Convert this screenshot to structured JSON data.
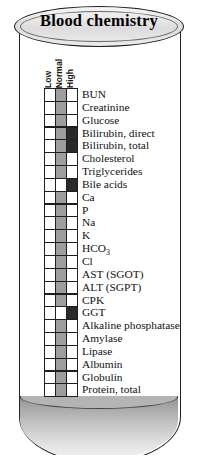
{
  "title": "Blood chemistry",
  "columns": [
    "Low",
    "Normal",
    "High"
  ],
  "legend": {
    "white": "not indicated",
    "gray": "normal range",
    "dark": "abnormal / elevated"
  },
  "colors": {
    "white": "#ffffff",
    "gray": "#9d9d9d",
    "dark": "#2a2a2a",
    "outline": "#1e1e1e",
    "fluid": "#b4b4b4"
  },
  "rows": [
    {
      "label": "BUN",
      "cells": [
        "white",
        "gray",
        "white"
      ]
    },
    {
      "label": "Creatinine",
      "cells": [
        "white",
        "gray",
        "white"
      ]
    },
    {
      "label": "Glucose",
      "cells": [
        "white",
        "gray",
        "white"
      ]
    },
    {
      "label": "Bilirubin, direct",
      "cells": [
        "white",
        "gray",
        "dark"
      ]
    },
    {
      "label": "Bilirubin, total",
      "cells": [
        "white",
        "gray",
        "dark"
      ]
    },
    {
      "label": "Cholesterol",
      "cells": [
        "white",
        "gray",
        "white"
      ]
    },
    {
      "label": "Triglycerides",
      "cells": [
        "white",
        "gray",
        "white"
      ]
    },
    {
      "label": "Bile acids",
      "cells": [
        "white",
        "white",
        "dark"
      ]
    },
    {
      "label": "Ca",
      "cells": [
        "white",
        "gray",
        "white"
      ]
    },
    {
      "label": "P",
      "cells": [
        "white",
        "gray",
        "white"
      ]
    },
    {
      "label": "Na",
      "cells": [
        "white",
        "gray",
        "white"
      ]
    },
    {
      "label": "K",
      "cells": [
        "white",
        "gray",
        "white"
      ]
    },
    {
      "label": "HCO3",
      "cells": [
        "white",
        "gray",
        "white"
      ]
    },
    {
      "label": "Cl",
      "cells": [
        "white",
        "gray",
        "white"
      ]
    },
    {
      "label": "AST (SGOT)",
      "cells": [
        "white",
        "gray",
        "white"
      ]
    },
    {
      "label": "ALT (SGPT)",
      "cells": [
        "white",
        "gray",
        "white"
      ]
    },
    {
      "label": "CPK",
      "cells": [
        "white",
        "gray",
        "white"
      ]
    },
    {
      "label": "GGT",
      "cells": [
        "white",
        "white",
        "dark"
      ]
    },
    {
      "label": "Alkaline phosphatase",
      "cells": [
        "white",
        "gray",
        "white"
      ]
    },
    {
      "label": "Amylase",
      "cells": [
        "white",
        "gray",
        "white"
      ]
    },
    {
      "label": "Lipase",
      "cells": [
        "white",
        "gray",
        "white"
      ]
    },
    {
      "label": "Albumin",
      "cells": [
        "white",
        "gray",
        "white"
      ]
    },
    {
      "label": "Globulin",
      "cells": [
        "white",
        "gray",
        "white"
      ]
    },
    {
      "label": "Protein, total",
      "cells": [
        "white",
        "gray",
        "white"
      ]
    }
  ]
}
